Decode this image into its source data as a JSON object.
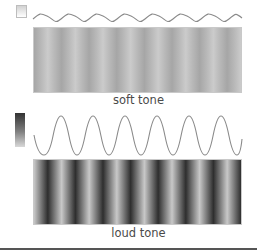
{
  "panels": [
    {
      "id": "soft",
      "label": "soft tone",
      "amplitude": "low",
      "cycles": 7.5,
      "stripe_contrast": "low",
      "stripe_colors": [
        "#a6a6a6",
        "#cbcbcb"
      ],
      "legend_gradient": [
        "#d2d2d2",
        "#ffffff"
      ]
    },
    {
      "id": "loud",
      "label": "loud tone",
      "amplitude": "high",
      "cycles": 7.5,
      "stripe_contrast": "high",
      "stripe_colors": [
        "#2e2e2e",
        "#c8c8c8"
      ],
      "legend_gradient": [
        "#333333",
        "#d8d8d8"
      ]
    }
  ],
  "colors": {
    "wave_stroke": "#8a8a8a",
    "label_text": "#4a4a4a",
    "rule": "#555555"
  }
}
